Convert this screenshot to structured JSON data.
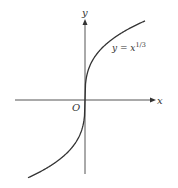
{
  "chart_data": {
    "type": "line",
    "title": "",
    "function_label": "y = x^(1/3)",
    "function_label_main": "y = x",
    "function_label_exp": "1/3",
    "xlabel": "x",
    "ylabel": "y",
    "origin_label": "O",
    "grid": false,
    "legend": "none",
    "series": [
      {
        "name": "y = x^(1/3)",
        "expression": "cube root of x",
        "x": [
          -8,
          -1,
          0,
          1,
          8
        ],
        "values": [
          -2,
          -1,
          0,
          1,
          2
        ]
      }
    ],
    "colors": {
      "curve": "#333333",
      "axes": "#555555",
      "text": "#333333"
    }
  }
}
